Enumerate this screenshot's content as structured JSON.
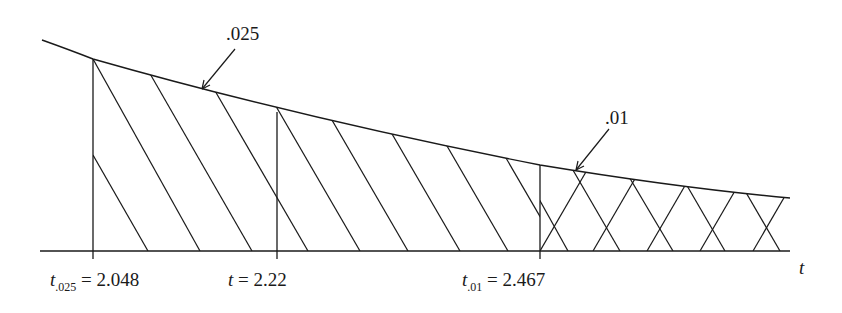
{
  "diagram": {
    "type": "t-distribution right tail with shaded rejection regions",
    "curve_annotations": [
      {
        "id": "alpha_025",
        "text": ".025"
      },
      {
        "id": "alpha_01",
        "text": ".01"
      }
    ],
    "axis_variable": "t",
    "critical_values": [
      {
        "id": "t025",
        "symbol": "t",
        "subscript": ".025",
        "equals": "=",
        "value": "2.048"
      },
      {
        "id": "tobs",
        "symbol": "t",
        "subscript": "",
        "equals": "=",
        "value": "2.22"
      },
      {
        "id": "t01",
        "symbol": "t",
        "subscript": ".01",
        "equals": "=",
        "value": "2.467"
      }
    ],
    "colors": {
      "line": "#1a1a1a",
      "background": "#ffffff"
    }
  }
}
